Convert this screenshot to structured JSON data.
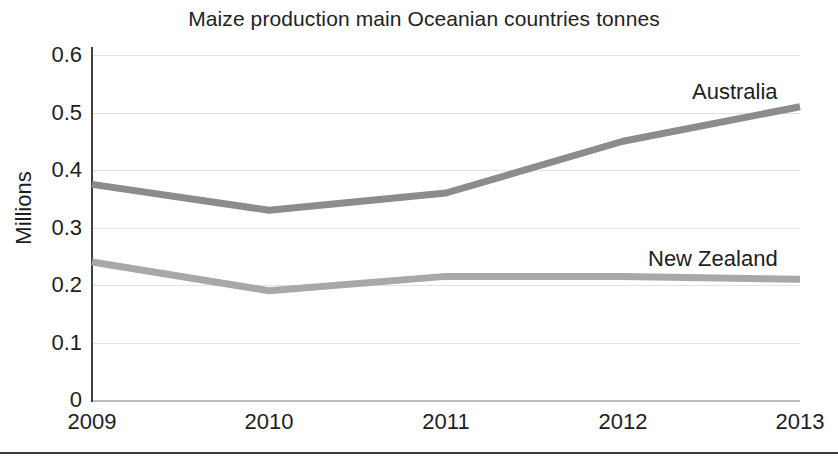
{
  "chart_data": {
    "type": "line",
    "title": "Maize production main Oceanian countries tonnes",
    "xlabel": "",
    "ylabel": "Millions",
    "categories": [
      "2009",
      "2010",
      "2011",
      "2012",
      "2013"
    ],
    "x": [
      2009,
      2010,
      2011,
      2012,
      2013
    ],
    "ylim": [
      0,
      0.6
    ],
    "yticks": [
      "0",
      "0.1",
      "0.2",
      "0.3",
      "0.4",
      "0.5",
      "0.6"
    ],
    "ytick_values": [
      0,
      0.1,
      0.2,
      0.3,
      0.4,
      0.5,
      0.6
    ],
    "grid": true,
    "legend_position": "inline-right-of-series",
    "series": [
      {
        "name": "Australia",
        "color": "#8c8c8c",
        "values": [
          0.375,
          0.33,
          0.36,
          0.45,
          0.51
        ]
      },
      {
        "name": "New Zealand",
        "color": "#a8a8a8",
        "values": [
          0.24,
          0.19,
          0.215,
          0.215,
          0.21
        ]
      }
    ]
  }
}
